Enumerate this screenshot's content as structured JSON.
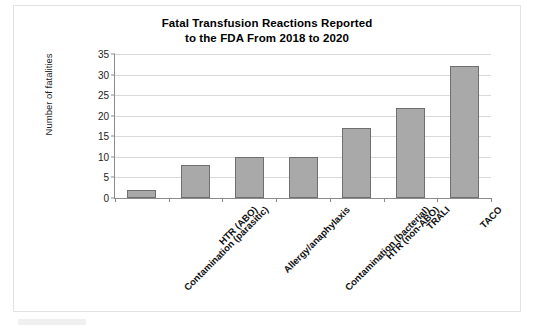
{
  "figure": {
    "title_line1": "Fatal Transfusion Reactions Reported",
    "title_line2": "to the FDA From 2018 to 2020",
    "bar_color": "#a9a9a9",
    "bar_border_color": "#6f6f6f",
    "grid_color": "#d9d9d9",
    "axis_color": "#8c8c8c",
    "frame_color": "#e3e3e3",
    "background": "#ffffff"
  },
  "chart_data": {
    "type": "bar",
    "title": "Fatal Transfusion Reactions Reported to the FDA From 2018 to 2020",
    "xlabel": "",
    "ylabel": "Number of fatalities",
    "categories": [
      "Contamination (parasitic)",
      "HTR (ABO)",
      "Allergy/anaphylaxis",
      "Contamination (bacterial)",
      "HTR (non-ABO)",
      "TRALI",
      "TACO"
    ],
    "values": [
      2,
      8,
      10,
      10,
      17,
      22,
      32
    ],
    "ylim": [
      0,
      35
    ],
    "ytick_values": [
      0,
      5,
      10,
      15,
      20,
      25,
      30,
      35
    ],
    "ytick_labels": [
      "0",
      "5",
      "10",
      "15",
      "20",
      "25",
      "30",
      "35"
    ],
    "grid": "horizontal",
    "legend": "none",
    "orientation": "vertical",
    "xtick_label_rotation": -45
  }
}
